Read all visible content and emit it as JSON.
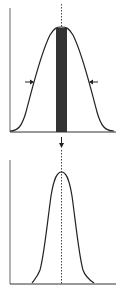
{
  "diagram": {
    "colors": {
      "background": "#ffffff",
      "line": "#222222",
      "axis": "#555555",
      "band": "#333333",
      "dotted": "#444444"
    },
    "top_panel": {
      "curve": "wide-gaussian",
      "band": "central-dark-band",
      "arrows": [
        "arrow-right-pointing-inward",
        "arrow-left-pointing-inward"
      ]
    },
    "transition": {
      "arrow": "arrow-down"
    },
    "bottom_panel": {
      "curve": "narrow-gaussian"
    }
  }
}
